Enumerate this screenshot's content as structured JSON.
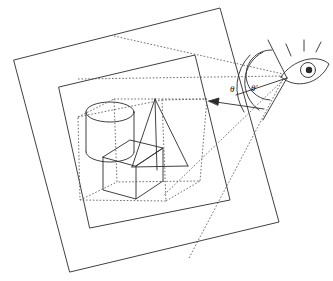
{
  "figure": {
    "background_color": "#ffffff",
    "stroke_color": "#2b2b2b",
    "dotted_color": "#555555",
    "width": 333,
    "height": 281
  },
  "labels": {
    "theta": "θ",
    "theta_prime": "θ′"
  },
  "annotations": {
    "view_arrow_name": "view-direction-arrow",
    "eye_name": "observer-eye"
  },
  "planes": {
    "outer_plane_name": "outer-image-plane",
    "middle_plane_name": "middle-image-plane",
    "inner_plane_name": "inner-dotted-frustum-box"
  },
  "objects": {
    "cylinder": "cylinder",
    "cube": "cube",
    "cone": "cone"
  }
}
